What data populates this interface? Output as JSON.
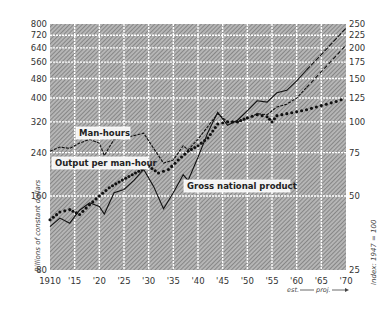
{
  "chart_data": {
    "type": "line",
    "title": "",
    "xlabel": "",
    "ylabel_left": "Billions of constant dollars",
    "ylabel_right": "Index: 1947 = 100",
    "x_tick_labels": [
      "1910",
      "'15",
      "'20",
      "'25",
      "'30",
      "'35",
      "'40",
      "'45",
      "'50",
      "'55",
      "'60",
      "'65",
      "'70"
    ],
    "x_range": [
      1910,
      1970
    ],
    "left_axis": {
      "scale": "log",
      "range": [
        80,
        800
      ],
      "ticks": [
        80,
        160,
        240,
        320,
        400,
        480,
        560,
        640,
        720,
        800
      ]
    },
    "right_axis": {
      "scale": "log",
      "range": [
        25,
        250
      ],
      "ticks": [
        25,
        50,
        75,
        100,
        125,
        150,
        175,
        200,
        225,
        250
      ]
    },
    "grid": true,
    "background": "crosshatch",
    "annotations": {
      "estimate_projection": "est. —— proj. ——>",
      "est_label": "est.",
      "proj_label": "proj."
    },
    "series": [
      {
        "name": "Gross national product",
        "axis": "left",
        "style": "solid",
        "projection_style": "dashed",
        "x": [
          1910,
          1912,
          1914,
          1916,
          1918,
          1920,
          1921,
          1923,
          1925,
          1927,
          1929,
          1931,
          1933,
          1935,
          1937,
          1938,
          1940,
          1942,
          1944,
          1946,
          1948,
          1950,
          1952,
          1954,
          1956,
          1958,
          1960,
          1962,
          1965,
          1970
        ],
        "values": [
          120,
          130,
          124,
          140,
          150,
          145,
          135,
          165,
          170,
          185,
          205,
          175,
          142,
          165,
          195,
          185,
          230,
          290,
          350,
          310,
          325,
          355,
          390,
          385,
          420,
          430,
          470,
          520,
          600,
          770
        ],
        "projection_values_1970": 770
      },
      {
        "name": "Output per man-hour",
        "axis": "right",
        "style": "dotted",
        "x": [
          1910,
          1912,
          1914,
          1916,
          1918,
          1920,
          1922,
          1924,
          1926,
          1928,
          1930,
          1932,
          1934,
          1936,
          1938,
          1940,
          1942,
          1944,
          1946,
          1948,
          1950,
          1952,
          1954,
          1955,
          1956,
          1958,
          1960,
          1962,
          1964,
          1966,
          1968,
          1970
        ],
        "values": [
          40,
          43,
          44,
          42,
          46,
          50,
          54,
          57,
          60,
          63,
          66,
          62,
          64,
          70,
          76,
          80,
          86,
          98,
          100,
          100,
          104,
          107,
          105,
          100,
          106,
          108,
          110,
          112,
          115,
          118,
          121,
          125
        ]
      },
      {
        "name": "Man-hours",
        "axis": "right",
        "style": "dash-dot",
        "projection_style": "dashed",
        "x": [
          1910,
          1912,
          1914,
          1916,
          1918,
          1920,
          1921,
          1923,
          1925,
          1927,
          1929,
          1931,
          1933,
          1935,
          1937,
          1938,
          1940,
          1942,
          1944,
          1946,
          1948,
          1950,
          1952,
          1954,
          1956,
          1958,
          1960,
          1962,
          1965,
          1970
        ],
        "values": [
          76,
          79,
          78,
          82,
          85,
          82,
          73,
          85,
          86,
          88,
          90,
          78,
          68,
          70,
          80,
          77,
          85,
          96,
          108,
          100,
          100,
          103,
          108,
          107,
          115,
          118,
          125,
          138,
          160,
          205
        ]
      }
    ],
    "labels": [
      {
        "text": "Man-hours",
        "series": "Man-hours"
      },
      {
        "text": "Output per man-hour",
        "series": "Output per man-hour"
      },
      {
        "text": "Gross national product",
        "series": "Gross national product"
      }
    ]
  },
  "ui": {
    "left_ylabel": "Billions of constant dollars",
    "right_ylabel": "Index: 1947 = 100",
    "est": "est.",
    "proj": "proj.",
    "label_manhours": "Man-hours",
    "label_output": "Output per man-hour",
    "label_gnp": "Gross national product"
  }
}
